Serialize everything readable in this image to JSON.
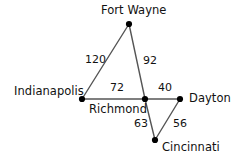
{
  "graph": {
    "type": "weighted-undirected-graph",
    "background_color": "#ffffff",
    "edge_color": "#555555",
    "node_color": "#000000",
    "text_color": "#111111",
    "nodes": [
      {
        "id": "fort-wayne",
        "label": "Fort Wayne",
        "x": 129,
        "y": 24,
        "label_x": 101,
        "label_y": 5,
        "label_anchor": "above"
      },
      {
        "id": "indianapolis",
        "label": "Indianapolis",
        "x": 82,
        "y": 99,
        "label_x": 14,
        "label_y": 86,
        "label_anchor": "left"
      },
      {
        "id": "richmond",
        "label": "Richmond",
        "x": 145,
        "y": 99,
        "label_x": 89,
        "label_y": 104,
        "label_anchor": "below-left"
      },
      {
        "id": "dayton",
        "label": "Dayton",
        "x": 180,
        "y": 99,
        "label_x": 189,
        "label_y": 93,
        "label_anchor": "right"
      },
      {
        "id": "cincinnati",
        "label": "Cincinnati",
        "x": 155,
        "y": 140,
        "label_x": 162,
        "label_y": 142,
        "label_anchor": "below-right"
      }
    ],
    "edges": [
      {
        "id": "indianapolis-fort-wayne",
        "from": "indianapolis",
        "to": "fort-wayne",
        "weight": "120",
        "label_x": 85,
        "label_y": 54
      },
      {
        "id": "fort-wayne-richmond",
        "from": "fort-wayne",
        "to": "richmond",
        "weight": "92",
        "label_x": 143,
        "label_y": 55
      },
      {
        "id": "indianapolis-richmond",
        "from": "indianapolis",
        "to": "richmond",
        "weight": "72",
        "label_x": 110,
        "label_y": 82
      },
      {
        "id": "richmond-dayton",
        "from": "richmond",
        "to": "dayton",
        "weight": "40",
        "label_x": 158,
        "label_y": 82
      },
      {
        "id": "richmond-cincinnati",
        "from": "richmond",
        "to": "cincinnati",
        "weight": "63",
        "label_x": 134,
        "label_y": 118
      },
      {
        "id": "cincinnati-dayton",
        "from": "cincinnati",
        "to": "dayton",
        "weight": "56",
        "label_x": 173,
        "label_y": 118
      }
    ]
  }
}
